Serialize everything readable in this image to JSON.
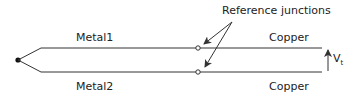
{
  "diagram": {
    "labels": {
      "metal1": "Metal1",
      "metal2": "Metal2",
      "copper_top": "Copper",
      "copper_bottom": "Copper",
      "reference": "Reference junctions",
      "voltage": "V",
      "voltage_sub": "t"
    },
    "colors": {
      "line": "#333333",
      "text": "#222222"
    }
  }
}
